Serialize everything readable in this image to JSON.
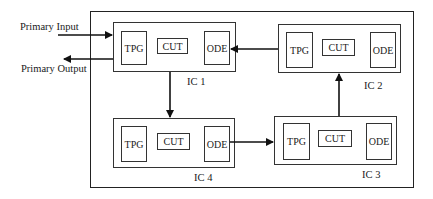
{
  "diagram": {
    "external": {
      "input_label": "Primary Input",
      "output_label": "Primary Output"
    },
    "ics": [
      {
        "id": "ic1",
        "label": "IC 1",
        "blocks": [
          "TPG",
          "CUT",
          "ODE"
        ]
      },
      {
        "id": "ic2",
        "label": "IC 2",
        "blocks": [
          "TPG",
          "CUT",
          "ODE"
        ]
      },
      {
        "id": "ic3",
        "label": "IC 3",
        "blocks": [
          "TPG",
          "CUT",
          "ODE"
        ]
      },
      {
        "id": "ic4",
        "label": "IC 4",
        "blocks": [
          "TPG",
          "CUT",
          "ODE"
        ]
      }
    ],
    "connections": [
      {
        "from": "Primary Input",
        "to": "IC 1"
      },
      {
        "from": "IC 1",
        "to": "Primary Output"
      },
      {
        "from": "IC 1",
        "to": "IC 4"
      },
      {
        "from": "IC 4",
        "to": "IC 3"
      },
      {
        "from": "IC 3",
        "to": "IC 2"
      },
      {
        "from": "IC 2",
        "to": "IC 1"
      }
    ]
  }
}
